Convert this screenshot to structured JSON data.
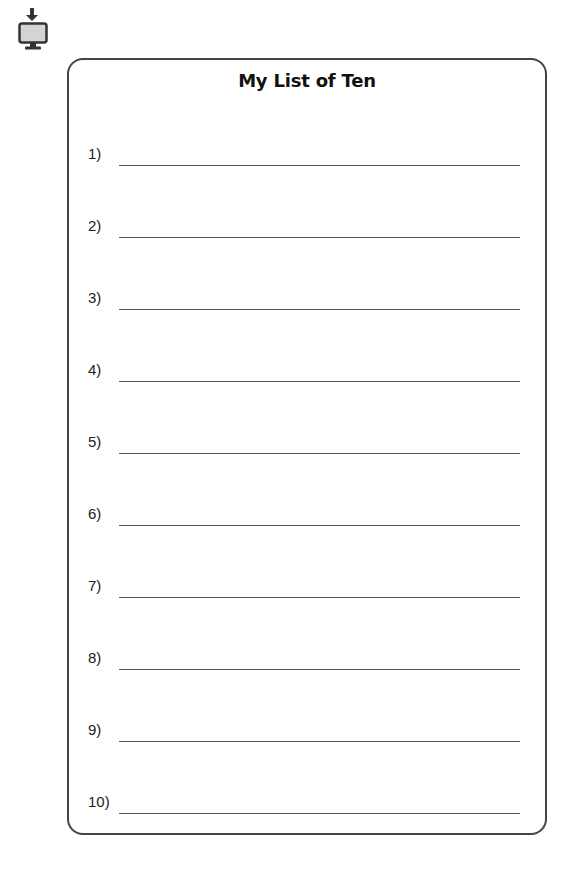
{
  "toolbar": {
    "download_icon": "download-to-monitor-icon"
  },
  "document": {
    "title": "My List of Ten",
    "items": [
      {
        "number": "1)",
        "value": ""
      },
      {
        "number": "2)",
        "value": ""
      },
      {
        "number": "3)",
        "value": ""
      },
      {
        "number": "4)",
        "value": ""
      },
      {
        "number": "5)",
        "value": ""
      },
      {
        "number": "6)",
        "value": ""
      },
      {
        "number": "7)",
        "value": ""
      },
      {
        "number": "8)",
        "value": ""
      },
      {
        "number": "9)",
        "value": ""
      },
      {
        "number": "10)",
        "value": ""
      }
    ]
  },
  "colors": {
    "border": "#444444",
    "line": "#555555",
    "text": "#111111",
    "icon_screen": "#d4d4d4",
    "icon_frame": "#333333"
  }
}
